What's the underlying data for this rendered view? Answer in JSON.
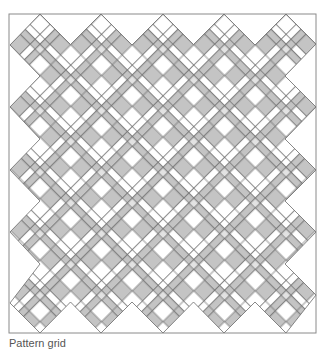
{
  "figure": {
    "kind": "quilt-pattern-diagram",
    "colors": {
      "frame": "#8a8a8a",
      "line": "#6a6a6a",
      "gray": "#c4c4c4",
      "light": "#e2e2e2",
      "white": "#ffffff"
    },
    "columns": 5,
    "rows": 5
  },
  "caption": {
    "text": "Pattern grid"
  }
}
